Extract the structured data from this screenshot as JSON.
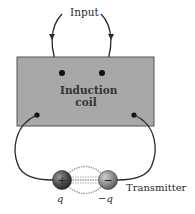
{
  "diagram": {
    "labels": {
      "input": "Input",
      "coil_line1": "Induction",
      "coil_line2": "coil",
      "charge_pos": "q",
      "charge_neg": "−q",
      "transmitter": "Transmitter"
    },
    "symbols": {
      "positive": "+",
      "negative": "−"
    },
    "colors": {
      "coil_fill": "#a8a8a8",
      "coil_border": "#555555",
      "wire": "#2a2a2a",
      "sphere_pos": "#555555",
      "sphere_neg": "#888888",
      "spark": "#999999"
    }
  }
}
